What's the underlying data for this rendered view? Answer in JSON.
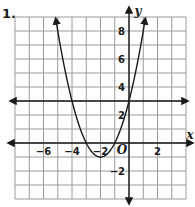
{
  "problem": {
    "number": "1."
  },
  "chart_data": {
    "type": "line",
    "title": "",
    "xlabel": "x",
    "ylabel": "y",
    "origin_label": "O",
    "xlim": [
      -8,
      4
    ],
    "ylim": [
      -4,
      9
    ],
    "grid": true,
    "x_tick_labels": [
      "-6",
      "-4",
      "-2",
      "2"
    ],
    "x_ticks": [
      -6,
      -4,
      -2,
      2
    ],
    "y_tick_labels": [
      "8",
      "6",
      "4",
      "2",
      "-2"
    ],
    "y_ticks": [
      8,
      6,
      4,
      2,
      -2
    ],
    "series": [
      {
        "name": "parabola",
        "equation": "y = x^2 + 4x + 3",
        "vertex": [
          -2,
          -1
        ],
        "points": [
          [
            -5,
            8
          ],
          [
            -4,
            3
          ],
          [
            -3,
            0
          ],
          [
            -2,
            -1
          ],
          [
            -1,
            0
          ],
          [
            0,
            3
          ],
          [
            1,
            8
          ]
        ],
        "arrows": "both ends"
      },
      {
        "name": "horizontal line",
        "equation": "y = 3",
        "points": [
          [
            -8,
            3
          ],
          [
            4,
            3
          ]
        ],
        "arrows": "both ends"
      }
    ],
    "colors": {
      "curve": "#1a1a1a",
      "grid": "#9a9a9a",
      "axis": "#1a1a1a"
    }
  }
}
